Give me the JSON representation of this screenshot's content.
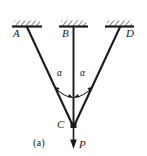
{
  "figure": {
    "caption": "(a)",
    "background_color": "#ffffff",
    "ink_color": "#1a1a1a",
    "width": 147,
    "height": 156
  },
  "nodes": {
    "a_label": "A",
    "b_label": "B",
    "d_label": "D",
    "c_label": "C"
  },
  "angles": {
    "left_label": "α",
    "right_label": "α"
  },
  "load": {
    "label": "P"
  },
  "supports": [
    {
      "name": "support-a",
      "hatched": true
    },
    {
      "name": "support-b",
      "hatched": true
    },
    {
      "name": "support-d",
      "hatched": true
    }
  ],
  "members": [
    {
      "name": "member-ac",
      "from": "A",
      "to": "C"
    },
    {
      "name": "member-bc",
      "from": "B",
      "to": "C"
    },
    {
      "name": "member-dc",
      "from": "D",
      "to": "C"
    }
  ]
}
